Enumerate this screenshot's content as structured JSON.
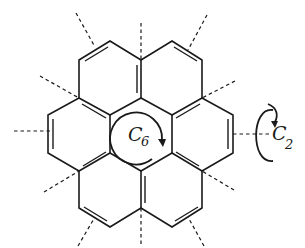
{
  "diagram": {
    "labels": {
      "c6_main": "C",
      "c6_sub": "6",
      "c2_main": "C",
      "c2_sub": "2"
    },
    "colors": {
      "ink": "#1a1a1a",
      "background": "#ffffff"
    }
  }
}
